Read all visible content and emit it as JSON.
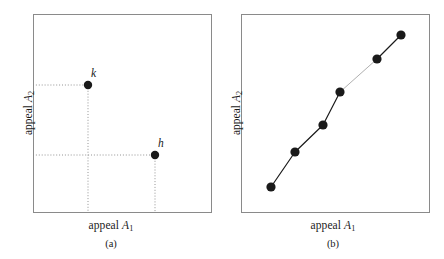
{
  "figure": {
    "background_color": "#ffffff",
    "frame_color": "#8a8a8a",
    "ink_color": "#1a1a1a",
    "guide_color": "#888888"
  },
  "panels": [
    {
      "id": "a",
      "caption": "(a)",
      "x_axis_label_text": "appeal ",
      "x_axis_label_var": "A",
      "x_axis_label_sub": "1",
      "y_axis_label_text": "appeal ",
      "y_axis_label_var": "A",
      "y_axis_label_sub": "2",
      "frame": {
        "x": 33,
        "y": 14,
        "width": 178,
        "height": 198
      },
      "points": [
        {
          "label": "k",
          "x": 88,
          "y": 85,
          "radius": 4.2,
          "label_dx": 3,
          "label_dy": -18
        },
        {
          "label": "h",
          "x": 155,
          "y": 155,
          "radius": 4.2,
          "label_dx": 3,
          "label_dy": -18
        }
      ],
      "guides": [
        {
          "from_x": 33,
          "from_y": 85,
          "to_x": 88,
          "to_y": 85
        },
        {
          "from_x": 88,
          "from_y": 85,
          "to_x": 88,
          "to_y": 212
        },
        {
          "from_x": 33,
          "from_y": 155,
          "to_x": 155,
          "to_y": 155
        },
        {
          "from_x": 155,
          "from_y": 155,
          "to_x": 155,
          "to_y": 212
        }
      ]
    },
    {
      "id": "b",
      "caption": "(b)",
      "x_axis_label_text": "appeal ",
      "x_axis_label_var": "A",
      "x_axis_label_sub": "1",
      "y_axis_label_text": "appeal ",
      "y_axis_label_var": "A",
      "y_axis_label_sub": "2",
      "frame": {
        "x": 19,
        "y": 14,
        "width": 188,
        "height": 198
      },
      "points": [
        {
          "label": "",
          "x": 49,
          "y": 187,
          "radius": 4.6
        },
        {
          "label": "",
          "x": 73,
          "y": 152,
          "radius": 4.6
        },
        {
          "label": "",
          "x": 101,
          "y": 125,
          "radius": 4.6
        },
        {
          "label": "",
          "x": 118,
          "y": 92,
          "radius": 4.6
        },
        {
          "label": "",
          "x": 155,
          "y": 59,
          "radius": 4.6
        },
        {
          "label": "",
          "x": 179,
          "y": 35,
          "radius": 4.6
        }
      ],
      "connectors": [
        {
          "from": 0,
          "to": 1,
          "style": "solid"
        },
        {
          "from": 1,
          "to": 2,
          "style": "solid"
        },
        {
          "from": 2,
          "to": 3,
          "style": "solid"
        },
        {
          "from": 3,
          "to": 4,
          "style": "light"
        },
        {
          "from": 4,
          "to": 5,
          "style": "solid"
        }
      ]
    }
  ],
  "chart_data": {
    "type": "scatter",
    "title": "",
    "subtitle": "",
    "panels": [
      {
        "id": "a",
        "caption": "(a)",
        "type": "scatter",
        "xlabel": "appeal A_1",
        "ylabel": "appeal A_2",
        "grid": false,
        "ticks": false,
        "legend": "none",
        "xlim": [
          0,
          1
        ],
        "ylim": [
          0,
          1
        ],
        "point_labels": [
          "k",
          "h"
        ],
        "x": [
          0.309,
          0.685
        ],
        "y": [
          0.641,
          0.288
        ],
        "guide_lines": "dotted projections from each point to both axes",
        "annotations": [
          "k",
          "h"
        ]
      },
      {
        "id": "b",
        "caption": "(b)",
        "type": "line",
        "xlabel": "appeal A_1",
        "ylabel": "appeal A_2",
        "grid": false,
        "ticks": false,
        "legend": "none",
        "xlim": [
          0,
          1
        ],
        "ylim": [
          0,
          1
        ],
        "series": [
          {
            "name": "monotone chain",
            "x": [
              0.16,
              0.287,
              0.436,
              0.527,
              0.723,
              0.851
            ],
            "y": [
              0.126,
              0.303,
              0.439,
              0.606,
              0.773,
              0.894
            ]
          }
        ],
        "annotations": []
      }
    ]
  }
}
